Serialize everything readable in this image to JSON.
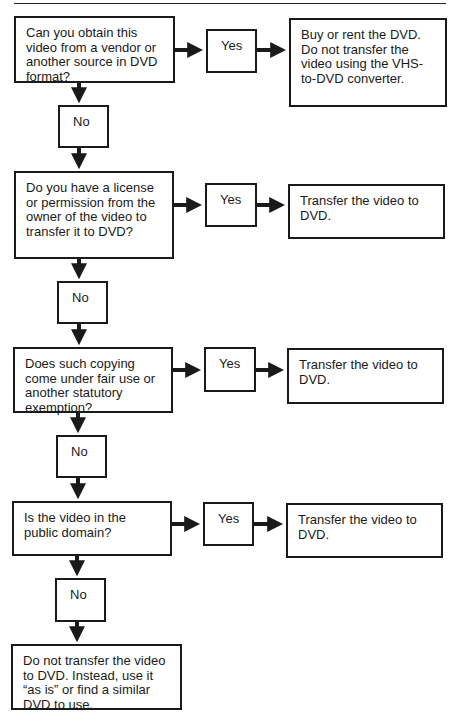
{
  "flowchart": {
    "steps": [
      {
        "question": "Can you obtain this video from a vendor or another source in DVD format?",
        "yes_label": "Yes",
        "yes_outcome": "Buy or rent the DVD. Do not transfer the video using the VHS-to-DVD converter.",
        "no_label": "No"
      },
      {
        "question": "Do you have a license or permission from the owner of the video to transfer it to DVD?",
        "yes_label": "Yes",
        "yes_outcome": "Transfer the video to DVD.",
        "no_label": "No"
      },
      {
        "question": "Does such copying come under fair use or another statutory exemption?",
        "yes_label": "Yes",
        "yes_outcome": "Transfer the video to DVD.",
        "no_label": "No"
      },
      {
        "question": "Is the video in the public domain?",
        "yes_label": "Yes",
        "yes_outcome": "Transfer the video to DVD.",
        "no_label": "No"
      }
    ],
    "final_outcome": "Do not transfer the video to DVD. Instead, use it “as is” or find a similar DVD to use."
  }
}
